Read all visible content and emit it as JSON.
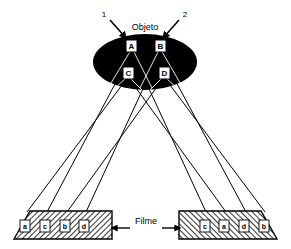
{
  "figure": {
    "title_label": "Objeto",
    "film_label": "Filme",
    "colors": {
      "object_fill": "#000000",
      "ray_stroke": "#000000",
      "film_fill": "#ffffff",
      "film_hatch": "#000000",
      "background": "#ffffff",
      "label_box_fill": "#ffffff"
    }
  },
  "sources": [
    {
      "id": "source-1",
      "label": "1",
      "x": 104,
      "y": 14,
      "arrow_from_x": 110,
      "arrow_from_y": 20,
      "arrow_to_x": 126,
      "arrow_to_y": 38
    },
    {
      "id": "source-2",
      "label": "2",
      "x": 185,
      "y": 14,
      "arrow_from_x": 179,
      "arrow_from_y": 20,
      "arrow_to_x": 163,
      "arrow_to_y": 38
    }
  ],
  "object": {
    "name": "Objeto",
    "cx": 145,
    "cy": 62,
    "rx": 52,
    "ry": 28,
    "points": [
      {
        "label": "A",
        "x": 131,
        "y": 46
      },
      {
        "label": "B",
        "x": 160,
        "y": 46
      },
      {
        "label": "C",
        "x": 128,
        "y": 73
      },
      {
        "label": "D",
        "x": 164,
        "y": 73
      }
    ]
  },
  "films": [
    {
      "id": "film-left",
      "name": "Filme esquerdo",
      "hatch": "left",
      "labels": [
        "a",
        "c",
        "b",
        "d"
      ],
      "label_x": [
        25,
        45,
        65,
        84
      ],
      "label_y": 226,
      "outline": "14,239 30,211 112,211 112,239"
    },
    {
      "id": "film-right",
      "name": "Filme direito",
      "hatch": "right",
      "labels": [
        "c",
        "a",
        "d",
        "b"
      ],
      "label_x": [
        205,
        224,
        244,
        264
      ],
      "label_y": 226,
      "outline": "179,239 179,211 261,211 277,239"
    }
  ],
  "rays": {
    "description": "Projecoes dos pontos A, B, C, D do objeto sobre os dois filmes",
    "left_bundle": [
      {
        "from": "C",
        "x1": 128,
        "y1": 77,
        "x2": 27,
        "y2": 212
      },
      {
        "from": "A",
        "x1": 132,
        "y1": 52,
        "x2": 47,
        "y2": 212
      },
      {
        "from": "D",
        "x1": 164,
        "y1": 77,
        "x2": 67,
        "y2": 212
      },
      {
        "from": "B",
        "x1": 160,
        "y1": 52,
        "x2": 86,
        "y2": 212
      }
    ],
    "right_bundle": [
      {
        "from": "A",
        "x1": 132,
        "y1": 52,
        "x2": 206,
        "y2": 212
      },
      {
        "from": "C",
        "x1": 128,
        "y1": 77,
        "x2": 226,
        "y2": 212
      },
      {
        "from": "B",
        "x1": 160,
        "y1": 52,
        "x2": 246,
        "y2": 212
      },
      {
        "from": "D",
        "x1": 164,
        "y1": 77,
        "x2": 265,
        "y2": 212
      }
    ]
  },
  "leader": {
    "label": "Filme",
    "label_x": 146,
    "label_y": 221,
    "left_line": {
      "x1": 112,
      "y1": 228,
      "x2": 130,
      "y2": 228
    },
    "right_line": {
      "x1": 162,
      "y1": 228,
      "x2": 180,
      "y2": 228
    }
  }
}
